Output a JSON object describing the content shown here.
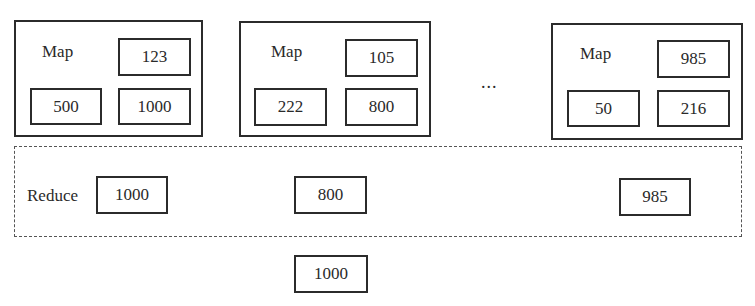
{
  "map_nodes": [
    {
      "label": "Map",
      "values": [
        "123",
        "500",
        "1000"
      ]
    },
    {
      "label": "Map",
      "values": [
        "105",
        "222",
        "800"
      ]
    },
    {
      "label": "Map",
      "values": [
        "985",
        "50",
        "216"
      ]
    }
  ],
  "ellipsis": "...",
  "reduce": {
    "label": "Reduce",
    "values": [
      "1000",
      "800",
      "985"
    ]
  },
  "result": "1000"
}
